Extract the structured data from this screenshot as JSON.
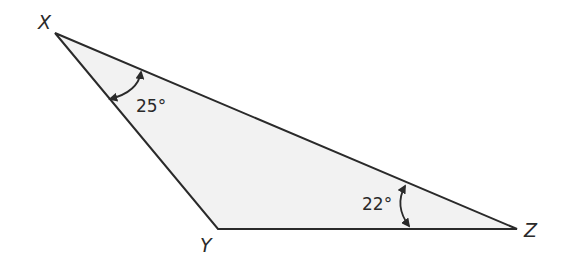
{
  "diagram": {
    "type": "triangle",
    "fill_color": "#f2f2f2",
    "stroke_color": "#2a2a2a",
    "vertices": [
      {
        "name": "X",
        "x": 55,
        "y": 33,
        "label_x": 38,
        "label_y": 29
      },
      {
        "name": "Y",
        "x": 218,
        "y": 229,
        "label_x": 200,
        "label_y": 252
      },
      {
        "name": "Z",
        "x": 517,
        "y": 229,
        "label_x": 524,
        "label_y": 237
      }
    ],
    "angles": [
      {
        "vertex": "X",
        "label": "25°",
        "label_x": 136,
        "label_y": 112
      },
      {
        "vertex": "Z",
        "label": "22°",
        "label_x": 362,
        "label_y": 210
      }
    ]
  }
}
